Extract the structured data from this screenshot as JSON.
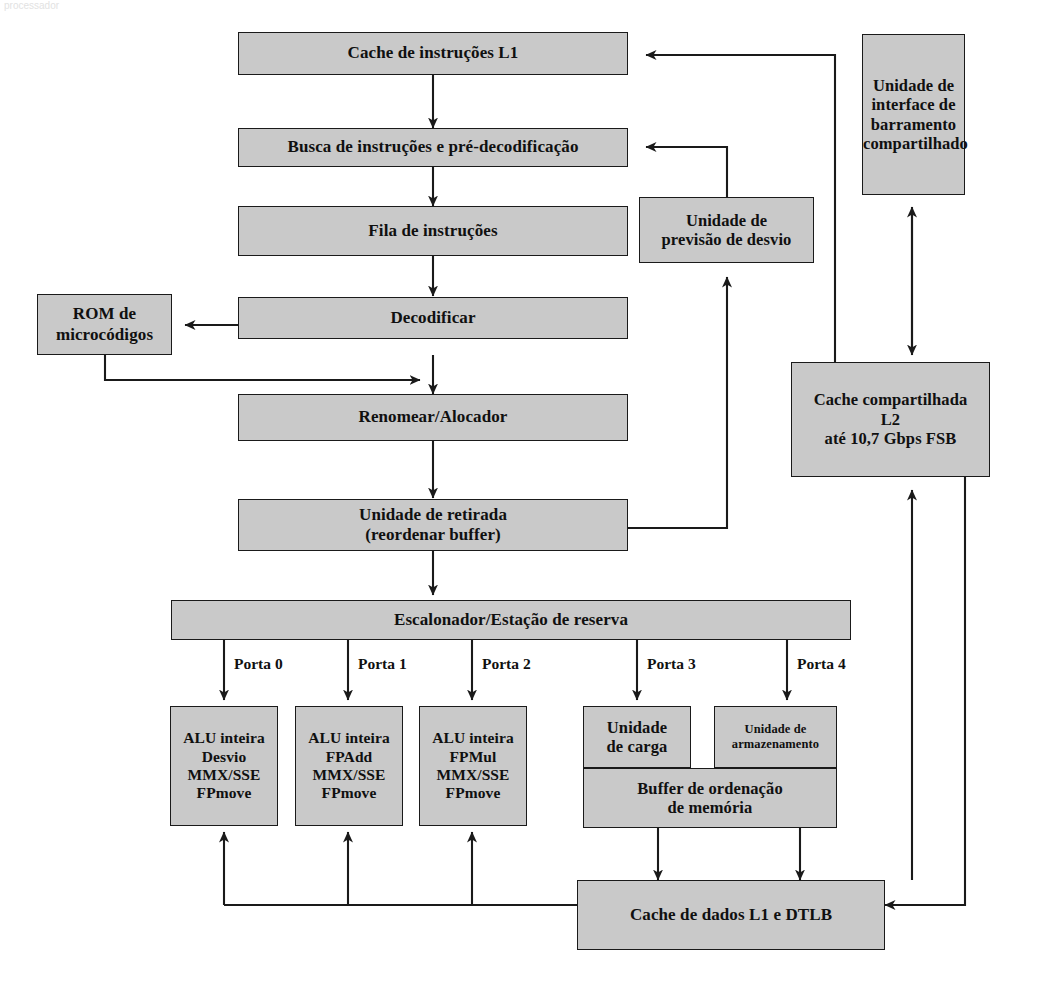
{
  "diagram": {
    "scan_artifact": "processador",
    "colors": {
      "box_fill": "#c9c9c9",
      "box_stroke": "#1a1a1a",
      "text": "#101010",
      "page_background": "#ffffff"
    },
    "boxes": {
      "l1_instruction_cache": {
        "label": "Cache de instruções L1"
      },
      "fetch_predecode": {
        "label": "Busca de instruções e pré-decodificação"
      },
      "instruction_queue": {
        "label": "Fila de instruções"
      },
      "decode": {
        "label": "Decodificar"
      },
      "microcode_rom": {
        "line1": "ROM de",
        "line2": "microcódigos"
      },
      "branch_prediction": {
        "line1": "Unidade de",
        "line2": "previsão de desvio"
      },
      "rename_allocate": {
        "label": "Renomear/Alocador"
      },
      "retirement_unit": {
        "line1": "Unidade de retirada",
        "line2": "(reordenar buffer)"
      },
      "scheduler": {
        "label": "Escalonador/Estação de reserva"
      },
      "bus_interface_unit": {
        "line1": "Unidade de",
        "line2": "interface de",
        "line3": "barramento",
        "line4": "compartilhado"
      },
      "l2_shared_cache": {
        "line1": "Cache compartilhada",
        "line2": "L2",
        "line3": "até 10,7 Gbps FSB"
      },
      "exec_unit_0": {
        "line1": "ALU inteira",
        "line2": "Desvio",
        "line3": "MMX/SSE",
        "line4": "FPmove"
      },
      "exec_unit_1": {
        "line1": "ALU inteira",
        "line2": "FPAdd",
        "line3": "MMX/SSE",
        "line4": "FPmove"
      },
      "exec_unit_2": {
        "line1": "ALU inteira",
        "line2": "FPMul",
        "line3": "MMX/SSE",
        "line4": "FPmove"
      },
      "load_unit": {
        "line1": "Unidade",
        "line2": "de carga"
      },
      "store_unit": {
        "line1": "Unidade de",
        "line2": "armazenamento"
      },
      "memory_order_buffer": {
        "line1": "Buffer de ordenação",
        "line2": "de memória"
      },
      "l1_data_cache": {
        "label": "Cache de dados L1 e DTLB"
      }
    },
    "port_labels": [
      {
        "name": "porta-0",
        "text": "Porta 0"
      },
      {
        "name": "porta-1",
        "text": "Porta 1"
      },
      {
        "name": "porta-2",
        "text": "Porta 2"
      },
      {
        "name": "porta-3",
        "text": "Porta 3"
      },
      {
        "name": "porta-4",
        "text": "Porta 4"
      }
    ]
  }
}
